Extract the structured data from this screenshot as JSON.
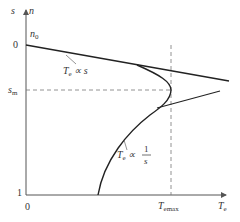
{
  "diagram": {
    "y_axis": {
      "label_s": "s",
      "label_n": "n",
      "ticks": {
        "n0": "n",
        "n0_sub": "0",
        "zero": "0",
        "sm": "s",
        "sm_sub": "m",
        "one": "1"
      }
    },
    "x_axis": {
      "label": "T",
      "label_sub": "e",
      "origin": "0",
      "tmax": "T",
      "tmax_sub": "emax"
    },
    "annotations": {
      "linear": {
        "text": "T",
        "sub": "e",
        "rel": " ∝ s"
      },
      "inverse": {
        "text": "T",
        "sub": "e",
        "rel": " ∝ ",
        "num": "1",
        "den": "s"
      }
    },
    "colors": {
      "curve": "#222222",
      "axis": "#555555",
      "dashed": "#777777"
    }
  }
}
